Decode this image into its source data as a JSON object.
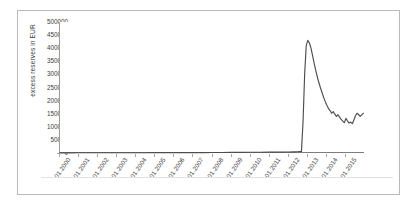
{
  "chart_data": {
    "type": "line",
    "title": "",
    "subtitle": "",
    "xlabel": "",
    "ylabel": "excess reserves in EUR",
    "ylim": [
      0,
      500000
    ],
    "ytick_labels": [
      "500000",
      "450000",
      "400000",
      "350000",
      "300000",
      "250000",
      "200000",
      "150000",
      "100000",
      "50000",
      "0"
    ],
    "ytick_values": [
      500000,
      450000,
      400000,
      350000,
      300000,
      250000,
      200000,
      150000,
      100000,
      50000,
      0
    ],
    "xtick_labels": [
      "01.2000",
      "01.2001",
      "01.2002",
      "01.2003",
      "01.2004",
      "01.2005",
      "01.2006",
      "01.2007",
      "01.2008",
      "01.2009",
      "01.2010",
      "01.2011",
      "01.2012",
      "01.2013",
      "01.2014",
      "01.2015"
    ],
    "xlim": [
      "01.2000",
      "01.2016"
    ],
    "grid": false,
    "legend": "none",
    "series": [
      {
        "name": "excess reserves",
        "color": "#4d4d4d",
        "x": [
          "01.2000",
          "07.2000",
          "01.2001",
          "07.2001",
          "01.2002",
          "07.2002",
          "01.2003",
          "07.2003",
          "01.2004",
          "07.2004",
          "01.2005",
          "07.2005",
          "01.2006",
          "07.2006",
          "01.2007",
          "07.2007",
          "01.2008",
          "07.2008",
          "01.2009",
          "07.2009",
          "01.2010",
          "07.2010",
          "01.2011",
          "07.2011",
          "01.2012",
          "04.2012",
          "07.2012",
          "09.2012",
          "10.2012",
          "11.2012",
          "12.2012",
          "01.2013",
          "02.2013",
          "03.2013",
          "04.2013",
          "05.2013",
          "06.2013",
          "07.2013",
          "08.2013",
          "09.2013",
          "10.2013",
          "11.2013",
          "12.2013",
          "01.2014",
          "02.2014",
          "03.2014",
          "04.2014",
          "05.2014",
          "06.2014",
          "07.2014",
          "08.2014",
          "09.2014",
          "10.2014",
          "11.2014",
          "12.2014",
          "01.2015",
          "02.2015",
          "03.2015",
          "04.2015",
          "05.2015",
          "06.2015",
          "07.2015",
          "08.2015",
          "09.2015",
          "10.2015",
          "12.2015"
        ],
        "values": [
          700,
          700,
          800,
          800,
          900,
          900,
          1000,
          1000,
          1100,
          1100,
          1200,
          1200,
          1300,
          1400,
          1500,
          1600,
          1800,
          2000,
          2300,
          2600,
          2800,
          3000,
          3200,
          3500,
          4000,
          4500,
          5000,
          6000,
          120000,
          300000,
          410000,
          430000,
          420000,
          400000,
          372000,
          342000,
          315000,
          290000,
          268000,
          248000,
          230000,
          212000,
          196000,
          182000,
          170000,
          162000,
          152000,
          158000,
          148000,
          140000,
          146000,
          137000,
          128000,
          122000,
          116000,
          132000,
          122000,
          114000,
          118000,
          112000,
          126000,
          142000,
          152000,
          146000,
          140000,
          152000
        ]
      }
    ],
    "annotations": []
  },
  "figure": {
    "background_color": "#ffffff",
    "frame_color": "#b9b9b9",
    "axis_color": "#8a8a8a",
    "line_color": "#4d4d4d"
  }
}
